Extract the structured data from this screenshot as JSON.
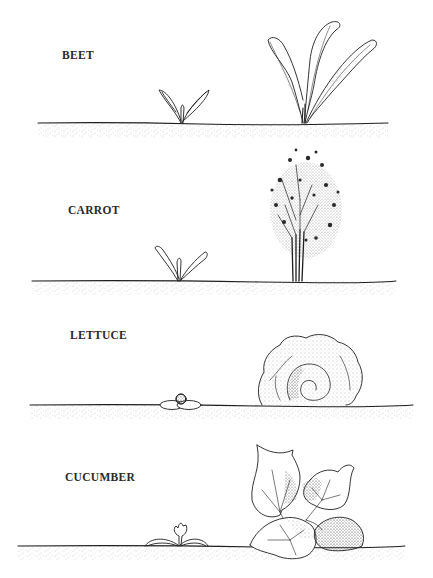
{
  "illustration": {
    "type": "plant-growth-comparison",
    "rows": [
      {
        "label": "BEET",
        "seedling": "beet-seedling",
        "mature": "beet-mature"
      },
      {
        "label": "CARROT",
        "seedling": "carrot-seedling",
        "mature": "carrot-mature"
      },
      {
        "label": "LETTUCE",
        "seedling": "lettuce-seedling",
        "mature": "lettuce-mature"
      },
      {
        "label": "CUCUMBER",
        "seedling": "cucumber-seedling",
        "mature": "cucumber-mature"
      }
    ],
    "colors": {
      "ink": "#1e1e1e",
      "paper": "#ffffff",
      "soil_stipple": "#8a8a8a"
    }
  }
}
